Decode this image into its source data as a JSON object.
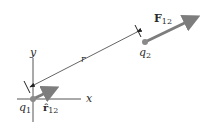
{
  "diagram": {
    "colors": {
      "axes": "#555555",
      "charge": "#8a8a8a",
      "vector": "#7d7d7d",
      "distance_line": "#222222",
      "text": "#2a2a2a"
    },
    "axes": {
      "x_label": "x",
      "y_label": "y"
    },
    "charges": [
      {
        "id": "q1",
        "label": "q",
        "subscript": "1"
      },
      {
        "id": "q2",
        "label": "q",
        "subscript": "2"
      }
    ],
    "vectors": {
      "force": {
        "label": "F",
        "subscript": "12"
      },
      "unit": {
        "label": "r̂",
        "subscript": "12"
      }
    },
    "distance": {
      "label": "r"
    }
  }
}
